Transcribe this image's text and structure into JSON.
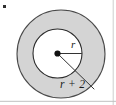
{
  "figure": {
    "type": "geometry-diagram",
    "background_color": "#ffffff",
    "canvas": {
      "width": 116,
      "height": 105
    },
    "shapes": {
      "outer_circle": {
        "name": "outer-circle",
        "cx": 61,
        "cy": 54,
        "r": 44,
        "fill": "#d4d4d4",
        "stroke": "#4a4a4a",
        "stroke_width": 1.1,
        "radius_label": "r + 2"
      },
      "inner_circle": {
        "name": "inner-circle",
        "cx": 57.5,
        "cy": 53.5,
        "r": 24.5,
        "fill": "#ffffff",
        "stroke": "#2b2b2b",
        "stroke_width": 1.1,
        "radius_label": "r"
      },
      "center_dot": {
        "name": "center-point",
        "cx": 57.5,
        "cy": 53.5,
        "r": 3.1,
        "fill": "#111111"
      }
    },
    "leaders": {
      "inner_radius_line": {
        "x1": 57.5,
        "y1": 53.5,
        "x2": 81.5,
        "y2": 53.5,
        "stroke": "#333333",
        "stroke_width": 1
      },
      "outer_radius_line": {
        "x1": 57.5,
        "y1": 53.5,
        "x2": 94.0,
        "y2": 89.0,
        "stroke": "#333333",
        "stroke_width": 1
      }
    },
    "labels": {
      "inner_radius": {
        "text": "r",
        "x": 71,
        "y": 45
      },
      "outer_radius": {
        "text": "r + 2",
        "x": 60,
        "y": 88
      }
    },
    "artifacts": {
      "corner_mark": {
        "name": "corner-speck",
        "x": 3,
        "y": 5,
        "w": 3,
        "h": 3,
        "color": "#2f2f2f"
      },
      "right_edge_rule": {
        "name": "right-edge-line",
        "x": 113,
        "color": "#c8c8c8"
      },
      "bottom_edge_rule": {
        "name": "bottom-edge-line",
        "y": 101,
        "color": "#c0c0c0"
      }
    }
  }
}
